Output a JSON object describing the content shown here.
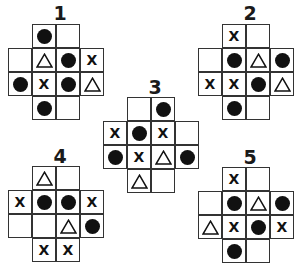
{
  "cell_size": 24,
  "symbol_legend": {
    "O": "filled-dot",
    "X": "x-mark",
    "T": "triangle-outline",
    "": "empty"
  },
  "puzzles": [
    {
      "label": "1",
      "origin": [
        8,
        24
      ],
      "title_pos": [
        48,
        4
      ],
      "rows": [
        {
          "row": 0,
          "start_col": 1,
          "cells": [
            "O",
            ""
          ]
        },
        {
          "row": 1,
          "start_col": 0,
          "cells": [
            "",
            "T",
            "O",
            "X"
          ]
        },
        {
          "row": 2,
          "start_col": 0,
          "cells": [
            "O",
            "X",
            "O",
            "T"
          ]
        },
        {
          "row": 3,
          "start_col": 1,
          "cells": [
            "O",
            ""
          ]
        }
      ]
    },
    {
      "label": "2",
      "origin": [
        198,
        24
      ],
      "title_pos": [
        238,
        4
      ],
      "rows": [
        {
          "row": 0,
          "start_col": 1,
          "cells": [
            "X",
            ""
          ]
        },
        {
          "row": 1,
          "start_col": 0,
          "cells": [
            "",
            "O",
            "T",
            "O"
          ]
        },
        {
          "row": 2,
          "start_col": 0,
          "cells": [
            "X",
            "X",
            "O",
            "T"
          ]
        },
        {
          "row": 3,
          "start_col": 1,
          "cells": [
            "O",
            ""
          ]
        }
      ]
    },
    {
      "label": "3",
      "origin": [
        103,
        97
      ],
      "title_pos": [
        143,
        78
      ],
      "rows": [
        {
          "row": 0,
          "start_col": 1,
          "cells": [
            "",
            "O"
          ]
        },
        {
          "row": 1,
          "start_col": 0,
          "cells": [
            "X",
            "O",
            "X",
            ""
          ]
        },
        {
          "row": 2,
          "start_col": 0,
          "cells": [
            "O",
            "X",
            "T",
            "O"
          ]
        },
        {
          "row": 3,
          "start_col": 1,
          "cells": [
            "T",
            ""
          ]
        }
      ]
    },
    {
      "label": "4",
      "origin": [
        8,
        166
      ],
      "title_pos": [
        48,
        147
      ],
      "rows": [
        {
          "row": 0,
          "start_col": 1,
          "cells": [
            "T",
            ""
          ]
        },
        {
          "row": 1,
          "start_col": 0,
          "cells": [
            "X",
            "O",
            "O",
            "X"
          ]
        },
        {
          "row": 2,
          "start_col": 0,
          "cells": [
            "",
            "",
            "T",
            "O"
          ]
        },
        {
          "row": 3,
          "start_col": 1,
          "cells": [
            "X",
            "X"
          ]
        }
      ]
    },
    {
      "label": "5",
      "origin": [
        198,
        167
      ],
      "title_pos": [
        238,
        148
      ],
      "rows": [
        {
          "row": 0,
          "start_col": 1,
          "cells": [
            "X",
            ""
          ]
        },
        {
          "row": 1,
          "start_col": 0,
          "cells": [
            "",
            "O",
            "T",
            "O"
          ]
        },
        {
          "row": 2,
          "start_col": 0,
          "cells": [
            "T",
            "X",
            "O",
            "X"
          ]
        },
        {
          "row": 3,
          "start_col": 1,
          "cells": [
            "O",
            ""
          ]
        }
      ]
    }
  ],
  "colors": {
    "grid_line": "#333333",
    "symbol": "#111111",
    "background": "#ffffff"
  }
}
